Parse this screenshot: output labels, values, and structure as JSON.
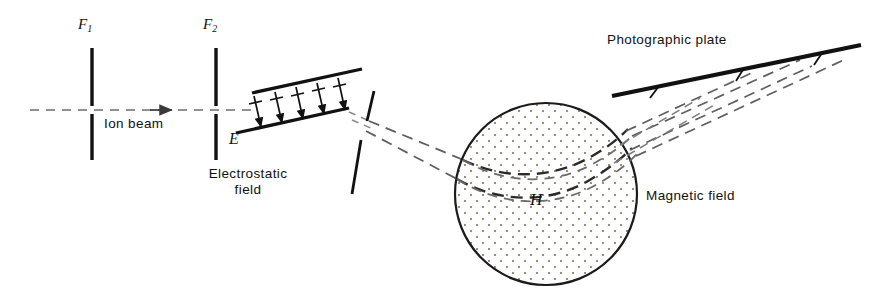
{
  "figure": {
    "type": "physics-apparatus-diagram",
    "width": 886,
    "height": 302,
    "background_color": "#ffffff",
    "ink_color": "#111111"
  },
  "labels": {
    "f1": "F",
    "f1_sub": "1",
    "f2": "F",
    "f2_sub": "2",
    "ion_beam": "Ion beam",
    "electrostatic_field_line1": "Electrostatic",
    "electrostatic_field_line2": "field",
    "e_field_symbol": "E",
    "h_field_symbol": "H",
    "magnetic_field": "Magnetic field",
    "photographic_plate": "Photographic plate"
  },
  "components": {
    "slit_f1": {
      "name": "F1 entrance slit",
      "x": 92,
      "y_top": 48,
      "y_bottom": 160,
      "gap_top": 106,
      "gap_bottom": 114,
      "thickness": 3.4
    },
    "slit_f2": {
      "name": "F2 collimating slit",
      "x": 216,
      "y_top": 48,
      "y_bottom": 160,
      "gap_top": 106,
      "gap_bottom": 114,
      "thickness": 3.4
    },
    "beam_axis": {
      "name": "ion beam axis",
      "x_start": 30,
      "x_end": 236,
      "y": 110,
      "style": "dashed",
      "arrow_x": 168,
      "arrow_y": 110
    },
    "electrostatic_analyzer": {
      "name": "electrostatic deflection plates",
      "upper_plate": {
        "x1": 252,
        "y1": 93,
        "x2": 360,
        "y2": 70
      },
      "lower_plate": {
        "x1": 237,
        "y1": 132,
        "x2": 348,
        "y2": 108
      },
      "field_arrow_count": 5,
      "arrow_direction": "downward between plates",
      "thickness": 3.2
    },
    "slit_after_analyzer": {
      "name": "energy-selecting slit",
      "x_top": 373,
      "y_top": 92,
      "x_bottom": 353,
      "y_bottom": 193,
      "gap_center_x": 365,
      "gap_center_y": 130,
      "thickness": 2.6
    },
    "magnetic_field_region": {
      "name": "magnetic field circle",
      "center_x": 546,
      "center_y": 194,
      "radius": 91,
      "fill": "stippled dot pattern",
      "stroke_width": 2.2
    },
    "photographic_plate": {
      "name": "photographic plate",
      "x1": 613,
      "y1": 95,
      "x2": 861,
      "y2": 45,
      "thickness": 4.2
    }
  },
  "beams": {
    "style": "dashed",
    "count_entering_magnet": 2,
    "count_exiting_magnet": 4,
    "description": "Ion beam is collimated by F1 and F2, energy-filtered by the electrostatic field E, dispersed by the magnetic field H, and focused onto the photographic plate."
  },
  "colors": {
    "ink": "#111111",
    "beam_dash": "#5a5a5a",
    "stipple": "#9b6a55"
  }
}
